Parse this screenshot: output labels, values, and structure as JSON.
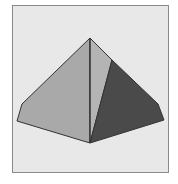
{
  "diagram": {
    "type": "3d-shape",
    "shape": "square-pyramid",
    "colors": {
      "background": "#e8e8e8",
      "frame_border": "#8a8a8a",
      "face_left": "#a9a9a9",
      "face_front_right": "#b4b4b4",
      "face_right": "#4a4a4a",
      "edge": "#333333"
    },
    "vertices": {
      "apex": [
        90,
        38
      ],
      "left_top": [
        22,
        104
      ],
      "left_bottom": [
        17,
        121
      ],
      "bottom": [
        90,
        143
      ],
      "right_bottom": [
        164,
        120
      ],
      "right_top": [
        158,
        104
      ],
      "ridge_point": [
        112,
        60
      ]
    }
  }
}
